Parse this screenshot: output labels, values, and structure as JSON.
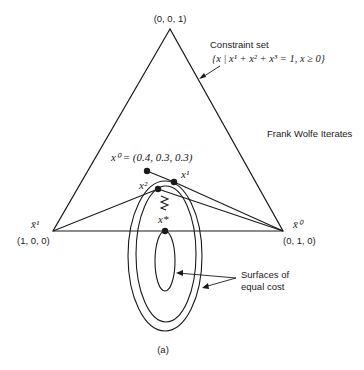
{
  "figure": {
    "caption": "(a)",
    "title": "Frank Wolfe Iterates",
    "constraint_set": {
      "label": "Constraint set",
      "formula": "{x | x¹ + x² + x³ = 1, x ≥ 0}"
    },
    "vertices": {
      "top": {
        "coord": "(0, 0, 1)"
      },
      "left": {
        "name": "x̄¹",
        "coord": "(1, 0, 0)"
      },
      "right": {
        "name": "x̄⁰",
        "coord": "(0, 1, 0)"
      }
    },
    "iterates": {
      "x0": {
        "label": "x⁰ = (0.4, 0.3, 0.3)"
      },
      "x1": {
        "label": "x¹"
      },
      "x2": {
        "label": "x²"
      },
      "xstar": {
        "label": "x*"
      }
    },
    "contours": {
      "label_line1": "Surfaces of",
      "label_line2": "equal cost"
    }
  }
}
